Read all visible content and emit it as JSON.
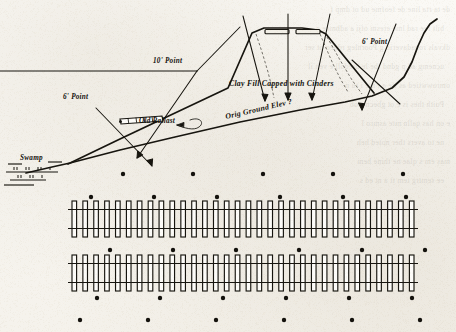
{
  "sheet": {
    "title": "Railway Embankment Cross-Section and Track Plan",
    "medium": "scanned-engineering-drawing",
    "paper_color": "#f7f5f0",
    "ink_color": "#17150f",
    "width": 456,
    "height": 332
  },
  "bleed_through": {
    "note": "faint mirrored text showing through from reverse side of page",
    "lines": [
      "de ta rta  line de feofme  ud  ot  dmp  f",
      "bilt ree rad  lme eresm  ofji a    adbmce g",
      "dkvals ronadaverio g  Poornleg rdneo ot ser",
      "ucnemg  ad p gdnd tbe  le bredoll e veh  il",
      "omrowwtied as tte  a   t   n  e   i  tu  n",
      "Poith thes is  e          ot  gbecmtrob",
      "e on  has  qalln mte  asmro l",
      "ne to  avers  ther noted  heh",
      "mas  em  s  qlae  ne  thine  bem",
      "ee semtrg  tem  tt a  nt  ed s"
    ]
  },
  "profile": {
    "name": "embankment-cross-section",
    "labels": [
      {
        "id": "six-point-left",
        "text": "6' Point",
        "x": 63,
        "y": 99,
        "rotate": 0
      },
      {
        "id": "ten-point",
        "text": "10' Point",
        "x": 153,
        "y": 63,
        "rotate": 0
      },
      {
        "id": "old-ballast",
        "text": "Old Ballast",
        "x": 139,
        "y": 123,
        "rotate": 0
      },
      {
        "id": "clay-fill",
        "text": "Clay Fill Capped with Cinders",
        "x": 229,
        "y": 86,
        "rotate": 0
      },
      {
        "id": "orig-ground",
        "text": "Orig Ground Elev ?",
        "x": 226,
        "y": 119,
        "rotate": -13
      },
      {
        "id": "six-point-right",
        "text": "6' Point",
        "x": 362,
        "y": 44,
        "rotate": 0
      },
      {
        "id": "swamp",
        "text": "Swamp",
        "x": 20,
        "y": 160,
        "rotate": 0
      }
    ]
  },
  "plan": {
    "name": "double-track-plan-view",
    "tracks": [
      {
        "id": "track-upper",
        "ties": 32
      },
      {
        "id": "track-lower",
        "ties": 32
      }
    ],
    "survey_points": {
      "rows": [
        {
          "id": "row-top",
          "y": 174,
          "count": 5,
          "x_start": 123,
          "x_step": 70
        },
        {
          "id": "row-above-upper",
          "y": 197,
          "count": 6,
          "x_start": 91,
          "x_step": 63
        },
        {
          "id": "row-between",
          "y": 250,
          "count": 6,
          "x_start": 110,
          "x_step": 63
        },
        {
          "id": "row-below-lower",
          "y": 298,
          "count": 6,
          "x_start": 97,
          "x_step": 63
        },
        {
          "id": "row-bottom",
          "y": 320,
          "count": 6,
          "x_start": 80,
          "x_step": 68
        }
      ]
    }
  }
}
